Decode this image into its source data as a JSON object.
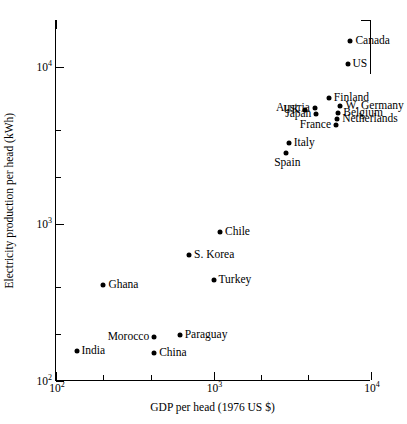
{
  "chart_data": {
    "type": "scatter",
    "title": "",
    "xlabel": "GDP per head  (1976 US $)",
    "ylabel": "Electricity production per head (kWh)",
    "xscale": "log",
    "yscale": "log",
    "xlim": [
      100,
      10000
    ],
    "ylim": [
      100,
      20000
    ],
    "grid": false,
    "legend": null,
    "xticks": [
      {
        "value": 100,
        "label": "10",
        "exp": "2",
        "type": "major"
      },
      {
        "value": 200,
        "label": "",
        "exp": "",
        "type": "minor"
      },
      {
        "value": 400,
        "label": "",
        "exp": "",
        "type": "minor"
      },
      {
        "value": 1000,
        "label": "10",
        "exp": "3",
        "type": "major"
      },
      {
        "value": 2000,
        "label": "",
        "exp": "",
        "type": "minor"
      },
      {
        "value": 4000,
        "label": "",
        "exp": "",
        "type": "minor"
      },
      {
        "value": 10000,
        "label": "10",
        "exp": "4",
        "type": "major"
      }
    ],
    "yticks": [
      {
        "value": 100,
        "label": "10",
        "exp": "2",
        "type": "major"
      },
      {
        "value": 200,
        "label": "",
        "exp": "",
        "type": "minor"
      },
      {
        "value": 400,
        "label": "",
        "exp": "",
        "type": "minor"
      },
      {
        "value": 1000,
        "label": "10",
        "exp": "3",
        "type": "major"
      },
      {
        "value": 2000,
        "label": "",
        "exp": "",
        "type": "minor"
      },
      {
        "value": 4000,
        "label": "",
        "exp": "",
        "type": "minor"
      },
      {
        "value": 10000,
        "label": "10",
        "exp": "4",
        "type": "major"
      }
    ],
    "points": [
      {
        "name": "Canada",
        "x": 7400,
        "y": 14800,
        "label_pos": "right"
      },
      {
        "name": "US",
        "x": 7100,
        "y": 10500,
        "label_pos": "right"
      },
      {
        "name": "Finland",
        "x": 5400,
        "y": 6400,
        "label_pos": "right"
      },
      {
        "name": "W. Germany",
        "x": 6400,
        "y": 5700,
        "label_pos": "right"
      },
      {
        "name": "Austria",
        "x": 4400,
        "y": 5500,
        "label_pos": "left"
      },
      {
        "name": "UK",
        "x": 3800,
        "y": 5300,
        "label_pos": "left"
      },
      {
        "name": "Belgium",
        "x": 6200,
        "y": 5100,
        "label_pos": "right"
      },
      {
        "name": "Japan",
        "x": 4500,
        "y": 5000,
        "label_pos": "left"
      },
      {
        "name": "Netherlands",
        "x": 6100,
        "y": 4700,
        "label_pos": "right"
      },
      {
        "name": "France",
        "x": 6000,
        "y": 4300,
        "label_pos": "left"
      },
      {
        "name": "Italy",
        "x": 3000,
        "y": 3300,
        "label_pos": "right"
      },
      {
        "name": "Spain",
        "x": 2900,
        "y": 2850,
        "label_pos": "below"
      },
      {
        "name": "Chile",
        "x": 1100,
        "y": 890,
        "label_pos": "right"
      },
      {
        "name": "S. Korea",
        "x": 700,
        "y": 640,
        "label_pos": "right"
      },
      {
        "name": "Turkey",
        "x": 1000,
        "y": 440,
        "label_pos": "right"
      },
      {
        "name": "Ghana",
        "x": 200,
        "y": 410,
        "label_pos": "right"
      },
      {
        "name": "Paraguay",
        "x": 610,
        "y": 195,
        "label_pos": "right"
      },
      {
        "name": "Morocco",
        "x": 420,
        "y": 190,
        "label_pos": "left"
      },
      {
        "name": "India",
        "x": 135,
        "y": 155,
        "label_pos": "right"
      },
      {
        "name": "China",
        "x": 420,
        "y": 150,
        "label_pos": "right"
      }
    ]
  }
}
